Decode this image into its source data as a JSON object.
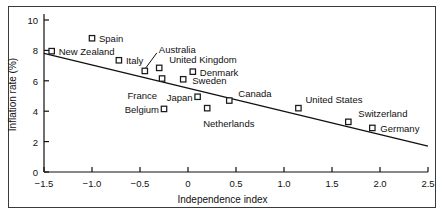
{
  "figure": {
    "background": "#ffffff",
    "frame_color": "#3a3a3a",
    "axis_color": "#101010",
    "marker_color": "#1a1a1a",
    "marker_fill": "#ffffff",
    "trend_color": "#101010"
  },
  "chart_data": {
    "type": "scatter",
    "title": "",
    "xlabel": "Independence index",
    "ylabel": "Inflation rate (%)",
    "xlim": [
      -1.5,
      2.5
    ],
    "ylim": [
      0,
      10
    ],
    "xticks": [
      "−1.5",
      "−1.0",
      "−0.5",
      "0",
      "0.5",
      "1.0",
      "1.5",
      "2.0",
      "2.5"
    ],
    "xtick_values": [
      -1.5,
      -1.0,
      -0.5,
      0,
      0.5,
      1.0,
      1.5,
      2.0,
      2.5
    ],
    "yticks": [
      "0",
      "2",
      "4",
      "6",
      "8",
      "10"
    ],
    "ytick_values": [
      0,
      2,
      4,
      6,
      8,
      10
    ],
    "grid": false,
    "legend": null,
    "points": [
      {
        "label": "New Zealand",
        "x": -1.42,
        "y": 7.95,
        "label_side": "right",
        "label_dx": 7,
        "label_dy": 0,
        "leader": false
      },
      {
        "label": "Spain",
        "x": -1.0,
        "y": 8.8,
        "label_side": "right",
        "label_dx": 7,
        "label_dy": 0,
        "leader": false
      },
      {
        "label": "Italy",
        "x": -0.72,
        "y": 7.35,
        "label_side": "right",
        "label_dx": 7,
        "label_dy": 0,
        "leader": false
      },
      {
        "label": "Australia",
        "x": -0.45,
        "y": 6.65,
        "label_side": "right",
        "label_dx": 14,
        "label_dy": -22,
        "leader": true
      },
      {
        "label": "United Kingdom",
        "x": -0.3,
        "y": 6.85,
        "label_side": "right",
        "label_dx": 10,
        "label_dy": -9,
        "leader": false
      },
      {
        "label": "France",
        "x": -0.27,
        "y": 6.15,
        "label_side": "left",
        "label_dx": -5,
        "label_dy": 16,
        "leader": false
      },
      {
        "label": "Denmark",
        "x": 0.05,
        "y": 6.6,
        "label_side": "right",
        "label_dx": 7,
        "label_dy": 0,
        "leader": false
      },
      {
        "label": "Sweden",
        "x": -0.05,
        "y": 6.1,
        "label_side": "right",
        "label_dx": 9,
        "label_dy": 1,
        "leader": false
      },
      {
        "label": "Japan",
        "x": 0.1,
        "y": 4.95,
        "label_side": "left",
        "label_dx": -5,
        "label_dy": 0,
        "leader": false
      },
      {
        "label": "Belgium",
        "x": -0.25,
        "y": 4.15,
        "label_side": "left",
        "label_dx": -5,
        "label_dy": 0,
        "leader": false
      },
      {
        "label": "Netherlands",
        "x": 0.2,
        "y": 4.2,
        "label_side": "right",
        "label_dx": -4,
        "label_dy": 15,
        "leader": false
      },
      {
        "label": "Canada",
        "x": 0.43,
        "y": 4.7,
        "label_side": "right",
        "label_dx": 9,
        "label_dy": -8,
        "leader": false
      },
      {
        "label": "United States",
        "x": 1.15,
        "y": 4.2,
        "label_side": "right",
        "label_dx": 7,
        "label_dy": -9,
        "leader": false
      },
      {
        "label": "Switzerland",
        "x": 1.67,
        "y": 3.3,
        "label_side": "right",
        "label_dx": 10,
        "label_dy": -9,
        "leader": false
      },
      {
        "label": "Germany",
        "x": 1.92,
        "y": 2.9,
        "label_side": "right",
        "label_dx": 8,
        "label_dy": 0,
        "leader": false
      }
    ],
    "trend_line": {
      "x1": -1.5,
      "y1": 7.8,
      "x2": 2.5,
      "y2": 1.7
    }
  }
}
